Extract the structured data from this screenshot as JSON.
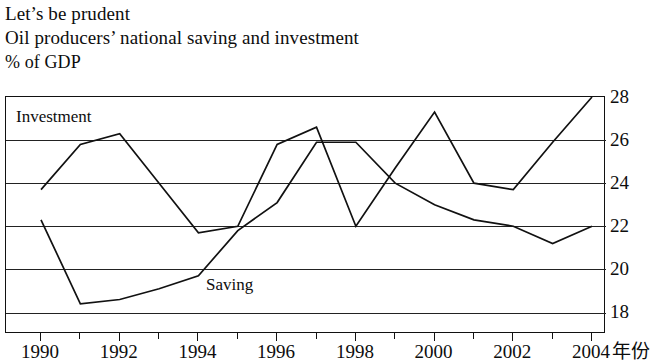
{
  "title": {
    "line1": "Let’s be prudent",
    "line2": "Oil producers’ national saving and investment",
    "line3": "% of GDP"
  },
  "labels": {
    "investment": "Investment",
    "saving": "Saving",
    "x_axis_title": "年份"
  },
  "axis": {
    "y_ticks": [
      "28",
      "26",
      "24",
      "22",
      "20",
      "18"
    ],
    "x_ticks": [
      "1990",
      "1992",
      "1994",
      "1996",
      "1998",
      "2000",
      "2002",
      "2004"
    ]
  },
  "colors": {
    "line": "#111111",
    "grid": "#222222",
    "frame": "#111111",
    "background": "#ffffff"
  },
  "chart_data": {
    "type": "line",
    "title": "Oil producers’ national saving and investment",
    "subtitle": "Let’s be prudent",
    "xlabel": "年份",
    "ylabel": "% of GDP",
    "x": [
      1990,
      1991,
      1992,
      1993,
      1994,
      1995,
      1996,
      1997,
      1998,
      1999,
      2000,
      2001,
      2002,
      2003,
      2004
    ],
    "xlim": [
      1990,
      2004
    ],
    "ylim": [
      17.0,
      28.0
    ],
    "y_gridlines": [
      18,
      20,
      22,
      24,
      26,
      28
    ],
    "grid": true,
    "legend": "inline-labels",
    "series": [
      {
        "name": "Investment",
        "values": [
          23.7,
          25.8,
          26.3,
          24.0,
          21.7,
          22.0,
          25.8,
          26.6,
          22.0,
          24.7,
          27.3,
          24.0,
          23.7,
          25.9,
          28.0
        ]
      },
      {
        "name": "Saving",
        "values": [
          22.3,
          18.4,
          18.6,
          19.1,
          19.7,
          21.8,
          23.1,
          25.9,
          25.9,
          24.0,
          23.0,
          22.3,
          22.0,
          21.2,
          22.0
        ]
      }
    ]
  }
}
